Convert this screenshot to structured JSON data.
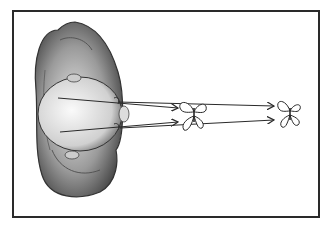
{
  "figure": {
    "elements": [
      {
        "name": "head-top-view",
        "kind": "illustration"
      },
      {
        "name": "near-butterfly",
        "kind": "illustration"
      },
      {
        "name": "far-butterfly",
        "kind": "illustration"
      },
      {
        "name": "sight-lines",
        "kind": "arrows",
        "count": 4
      }
    ],
    "colors": {
      "ink": "#2a2a2a",
      "shade": "#8a8a8a",
      "paper": "#ffffff"
    }
  }
}
